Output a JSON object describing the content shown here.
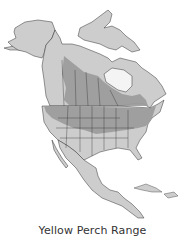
{
  "map": {
    "title": "Yellow Perch Range",
    "region": "North America",
    "legend": [
      {
        "label": "Range",
        "color": "#9a9a9a"
      },
      {
        "label": "Other land",
        "color": "#cdcdcd"
      }
    ],
    "colors": {
      "background": "#ffffff",
      "water": "#f4f4f4",
      "land": "#cdcdcd",
      "range": "#9a9a9a",
      "border": "#333333"
    }
  }
}
